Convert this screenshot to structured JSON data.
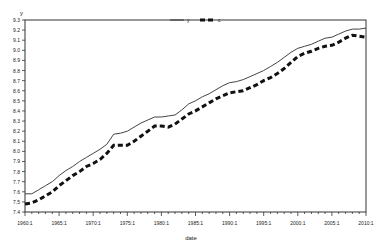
{
  "chart_data": {
    "type": "line",
    "title": "",
    "xlabel": "date",
    "ylabel": "y",
    "xlim": [
      1960,
      2010
    ],
    "ylim": [
      7.4,
      9.3
    ],
    "grid": false,
    "legend_position": "top-center",
    "x_ticks": [
      "1960:1",
      "1965:1",
      "1970:1",
      "1975:1",
      "1980:1",
      "1985:1",
      "1990:1",
      "1995:1",
      "2000:1",
      "2005:1",
      "2010:1"
    ],
    "y_ticks": [
      "7.4",
      "7.5",
      "7.6",
      "7.7",
      "7.8",
      "7.9",
      "8.0",
      "8.1",
      "8.2",
      "8.3",
      "8.4",
      "8.5",
      "8.6",
      "8.7",
      "8.8",
      "8.9",
      "9.0",
      "9.1",
      "9.2",
      "9.3"
    ],
    "x": [
      1960,
      1961,
      1962,
      1963,
      1964,
      1965,
      1966,
      1967,
      1968,
      1969,
      1970,
      1971,
      1972,
      1973,
      1974,
      1975,
      1976,
      1977,
      1978,
      1979,
      1980,
      1981,
      1982,
      1983,
      1984,
      1985,
      1986,
      1987,
      1988,
      1989,
      1990,
      1991,
      1992,
      1993,
      1994,
      1995,
      1996,
      1997,
      1998,
      1999,
      2000,
      2001,
      2002,
      2003,
      2004,
      2005,
      2006,
      2007,
      2008,
      2009,
      2010
    ],
    "series": [
      {
        "name": "y",
        "style": "solid",
        "values": [
          7.58,
          7.58,
          7.62,
          7.66,
          7.7,
          7.76,
          7.81,
          7.85,
          7.9,
          7.94,
          7.98,
          8.02,
          8.07,
          8.17,
          8.18,
          8.2,
          8.24,
          8.28,
          8.31,
          8.34,
          8.34,
          8.35,
          8.36,
          8.41,
          8.47,
          8.5,
          8.54,
          8.57,
          8.61,
          8.65,
          8.68,
          8.69,
          8.71,
          8.74,
          8.77,
          8.8,
          8.84,
          8.88,
          8.93,
          8.98,
          9.02,
          9.04,
          9.06,
          9.09,
          9.12,
          9.13,
          9.16,
          9.19,
          9.21,
          9.21,
          9.22
        ]
      },
      {
        "name": "c",
        "style": "dashed",
        "values": [
          7.48,
          7.49,
          7.52,
          7.56,
          7.6,
          7.66,
          7.71,
          7.76,
          7.8,
          7.85,
          7.88,
          7.92,
          7.98,
          8.06,
          8.06,
          8.06,
          8.1,
          8.15,
          8.2,
          8.25,
          8.25,
          8.24,
          8.27,
          8.32,
          8.37,
          8.4,
          8.44,
          8.48,
          8.52,
          8.55,
          8.58,
          8.59,
          8.6,
          8.63,
          8.66,
          8.7,
          8.73,
          8.77,
          8.82,
          8.88,
          8.94,
          8.97,
          8.99,
          9.02,
          9.04,
          9.05,
          9.08,
          9.12,
          9.15,
          9.14,
          9.13
        ]
      }
    ]
  },
  "legend": {
    "items": [
      "y",
      "c"
    ]
  },
  "axes": {
    "xlabel": "date",
    "ylabel": "y"
  }
}
